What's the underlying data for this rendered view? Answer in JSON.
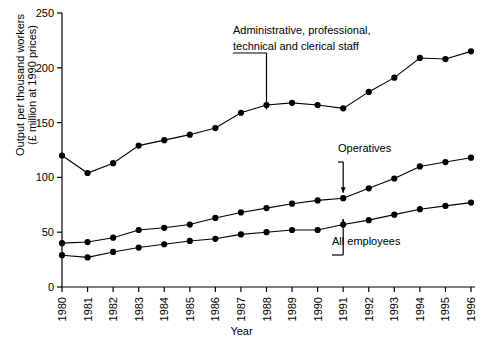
{
  "chart_data": {
    "type": "line",
    "title": "",
    "xlabel": "Year",
    "ylabel_line1": "Output per thousand workers",
    "ylabel_line2": "(£ million at 1990 prices)",
    "categories": [
      "1980",
      "1981",
      "1982",
      "1983",
      "1984",
      "1985",
      "1986",
      "1987",
      "1988",
      "1989",
      "1990",
      "1991",
      "1992",
      "1993",
      "1994",
      "1995",
      "1996"
    ],
    "ylim": [
      0,
      250
    ],
    "yticks": [
      0,
      50,
      100,
      150,
      200,
      250
    ],
    "grid": false,
    "legend_position": "inline-annotations",
    "series": [
      {
        "name": "Administrative, professional, technical and clerical staff",
        "values": [
          120,
          104,
          113,
          129,
          134,
          139,
          145,
          159,
          166,
          168,
          166,
          163,
          178,
          191,
          209,
          208,
          215
        ]
      },
      {
        "name": "Operatives",
        "values": [
          40,
          41,
          45,
          52,
          54,
          57,
          63,
          68,
          72,
          76,
          79,
          81,
          90,
          99,
          110,
          114,
          118
        ]
      },
      {
        "name": "All employees",
        "values": [
          29,
          27,
          32,
          36,
          39,
          42,
          44,
          48,
          50,
          52,
          52,
          57,
          61,
          66,
          71,
          74,
          77
        ]
      }
    ],
    "annotations": [
      {
        "name": "annotation-admin",
        "text_line1": "Administrative, professional,",
        "text_line2": "technical and clerical staff"
      },
      {
        "name": "annotation-operatives",
        "text": "Operatives"
      },
      {
        "name": "annotation-all-employees",
        "text": "All employees"
      }
    ]
  }
}
